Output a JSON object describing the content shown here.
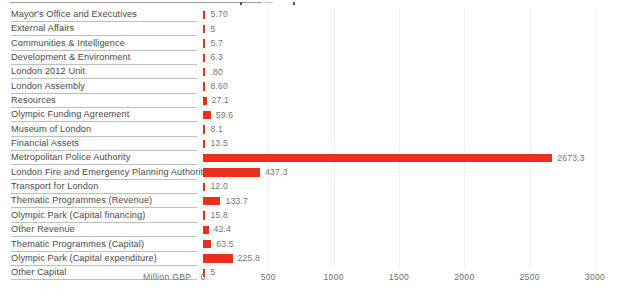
{
  "chart_data": {
    "type": "bar",
    "orientation": "horizontal",
    "title": "",
    "xlabel": "Million GBP",
    "ylabel": "",
    "xlim": [
      0,
      3000
    ],
    "xticks": [
      "0",
      "500",
      "1000",
      "1500",
      "2000",
      "2500",
      "3000"
    ],
    "grid": true,
    "legend": false,
    "bar_color": "#e8301c",
    "categories": [
      "Mayor's Office and Executives",
      "External Affairs",
      "Communities & Intelligence",
      "Development & Environment",
      "London 2012 Unit",
      "London Assembly",
      "Resources",
      "Olympic Funding Agreement",
      "Museum of London",
      "Financial Assets",
      "Metropolitan Police Authority",
      "London Fire and Emergency Planning Authority",
      "Transport for London",
      "Thematic Programmes (Revenue)",
      "Olympic Park (Capital financing)",
      "Other Revenue",
      "Thematic Programmes (Capital)",
      "Olympic Park (Capital expenditure)",
      "Other Capital"
    ],
    "values": [
      5.7,
      5,
      5.7,
      6.3,
      0.8,
      8.6,
      27.1,
      59.6,
      8.1,
      13.5,
      2673.3,
      437.3,
      12.0,
      133.7,
      15.8,
      42.4,
      63.5,
      225.8,
      5
    ],
    "value_labels": [
      "5.70",
      "5",
      "5.7",
      "6.3",
      ".80",
      "8.60",
      "27.1",
      "59.6",
      "8.1",
      "13.5",
      "2673.3",
      "437.3",
      "12.0",
      "133.7",
      "15.8",
      "42.4",
      "63.5",
      "225.8",
      "5"
    ]
  }
}
